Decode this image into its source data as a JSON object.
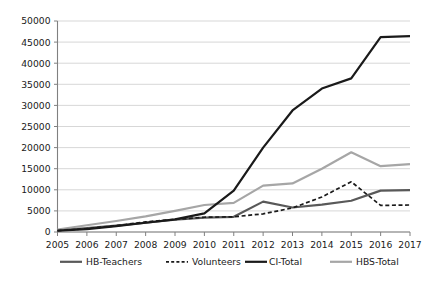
{
  "chart_data": {
    "type": "line",
    "title": "",
    "subtitle": "",
    "xlabel": "",
    "ylabel": "",
    "x": [
      2005,
      2006,
      2007,
      2008,
      2009,
      2010,
      2011,
      2012,
      2013,
      2014,
      2015,
      2016,
      2017
    ],
    "categories": [
      "2005",
      "2006",
      "2007",
      "2008",
      "2009",
      "2010",
      "2011",
      "2012",
      "2013",
      "2014",
      "2015",
      "2016",
      "2017"
    ],
    "xtick_labels": [
      "2005",
      "2006",
      "2007",
      "2008",
      "2009",
      "2010",
      "2011",
      "2012",
      "2013",
      "2014",
      "2015",
      "2016",
      "2017"
    ],
    "ytick_labels": [
      "0",
      "5000",
      "10000",
      "15000",
      "20000",
      "25000",
      "30000",
      "35000",
      "40000",
      "45000",
      "50000"
    ],
    "ytick_values": [
      0,
      5000,
      10000,
      15000,
      20000,
      25000,
      30000,
      35000,
      40000,
      45000,
      50000
    ],
    "ylim": [
      0,
      50000
    ],
    "xlim": [
      2005,
      2017
    ],
    "grid": "horizontal",
    "legend_position": "bottom",
    "series": [
      {
        "name": "HB-Teachers",
        "color": "#595959",
        "style": "solid",
        "width": 2.2,
        "values": [
          350,
          900,
          1500,
          2200,
          2900,
          3400,
          3600,
          7200,
          5800,
          6500,
          7400,
          9800,
          9900
        ]
      },
      {
        "name": "Volunteers",
        "color": "#1a1a1a",
        "style": "dashed",
        "width": 1.7,
        "values": [
          300,
          800,
          1500,
          2400,
          3000,
          3500,
          3600,
          4300,
          5700,
          8300,
          11900,
          6300,
          6400
        ]
      },
      {
        "name": "CI-Total",
        "color": "#1a1a1a",
        "style": "solid",
        "width": 2.2,
        "values": [
          300,
          700,
          1400,
          2200,
          3000,
          4400,
          9800,
          20000,
          28800,
          34000,
          36400,
          46200,
          46400
        ]
      },
      {
        "name": "HBS-Total",
        "color": "#a6a6a6",
        "style": "solid",
        "width": 2.2,
        "values": [
          600,
          1600,
          2600,
          3700,
          5000,
          6400,
          6900,
          11000,
          11500,
          15000,
          18900,
          15600,
          16100
        ]
      }
    ]
  },
  "legend": {
    "items": [
      {
        "label": "HB-Teachers"
      },
      {
        "label": "Volunteers"
      },
      {
        "label": "CI-Total"
      },
      {
        "label": "HBS-Total"
      }
    ]
  },
  "axes": {
    "y_axis_name": "value-axis",
    "x_axis_name": "year-axis"
  }
}
